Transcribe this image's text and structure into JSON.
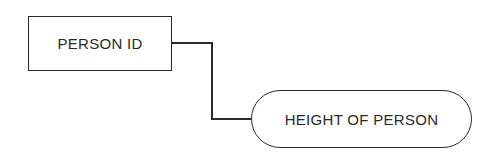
{
  "diagram": {
    "entity": {
      "label": "PERSON ID",
      "shape": "rectangle"
    },
    "attribute": {
      "label": "HEIGHT OF PERSON",
      "shape": "rounded-pill"
    },
    "connector": {
      "from": "PERSON ID",
      "to": "HEIGHT OF PERSON",
      "style": "orthogonal-elbow"
    },
    "colors": {
      "stroke": "#2a2a2a",
      "background": "#ffffff"
    }
  }
}
